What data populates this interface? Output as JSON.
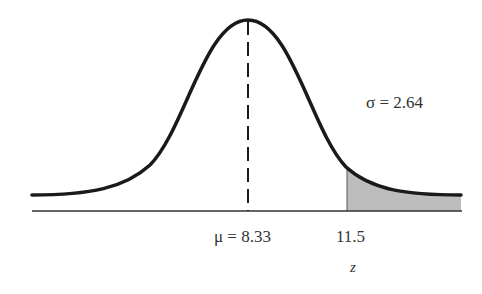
{
  "diagram": {
    "type": "normal-curve",
    "mean_label": "μ = 8.33",
    "sd_label": "σ = 2.64",
    "cutoff_label": "11.5",
    "axis_label": "z",
    "mean": 8.33,
    "sd": 2.64,
    "cutoff": 11.5,
    "shaded_region": "right tail beyond 11.5",
    "colors": {
      "curve": "#1a1a1a",
      "shade": "#bdbdbd",
      "axis": "#333333",
      "text": "#333333"
    }
  }
}
